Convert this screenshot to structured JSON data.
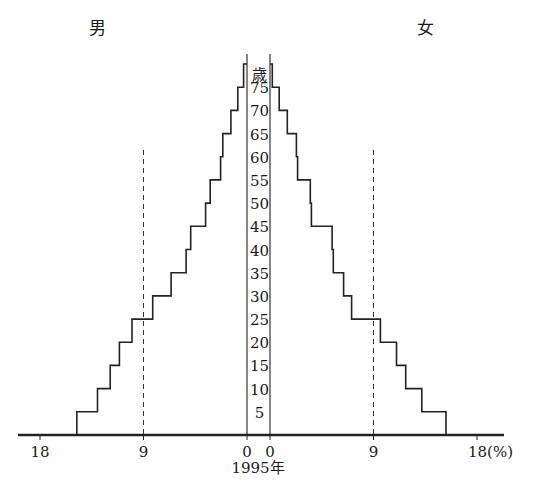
{
  "chart_data": {
    "type": "bar",
    "subtype": "population-pyramid",
    "title": "1995年",
    "xlabel": "(%)",
    "ylabel": "歳",
    "left_label": "男",
    "right_label": "女",
    "categories": [
      "0-4",
      "5-9",
      "10-14",
      "15-19",
      "20-24",
      "25-29",
      "30-34",
      "35-39",
      "40-44",
      "45-49",
      "50-54",
      "55-59",
      "60-64",
      "65-69",
      "70-74",
      "75+"
    ],
    "series": [
      {
        "name": "男",
        "side": "left",
        "values": [
          14.8,
          13.0,
          11.9,
          11.1,
          10.0,
          8.2,
          6.6,
          5.3,
          4.9,
          3.6,
          3.2,
          2.3,
          2.1,
          1.4,
          0.8,
          0.3
        ]
      },
      {
        "name": "女",
        "side": "right",
        "values": [
          15.3,
          13.2,
          11.8,
          11.0,
          9.6,
          7.1,
          6.4,
          5.5,
          5.4,
          3.6,
          3.5,
          2.4,
          2.3,
          1.5,
          0.8,
          0.2
        ]
      }
    ],
    "age_tick_labels": [
      "5",
      "10",
      "15",
      "20",
      "25",
      "30",
      "35",
      "40",
      "45",
      "50",
      "55",
      "60",
      "65",
      "70",
      "75"
    ],
    "age_unit_label": "歳",
    "x_ticks_left": [
      "18",
      "9",
      "0"
    ],
    "x_ticks_right": [
      "0",
      "9",
      "18(%)"
    ],
    "xlim": [
      0,
      18
    ],
    "reference_lines": [
      {
        "side": "left",
        "value": 9,
        "style": "dashed"
      },
      {
        "side": "right",
        "value": 9,
        "style": "dashed"
      }
    ],
    "grid": false,
    "legend": "none"
  }
}
